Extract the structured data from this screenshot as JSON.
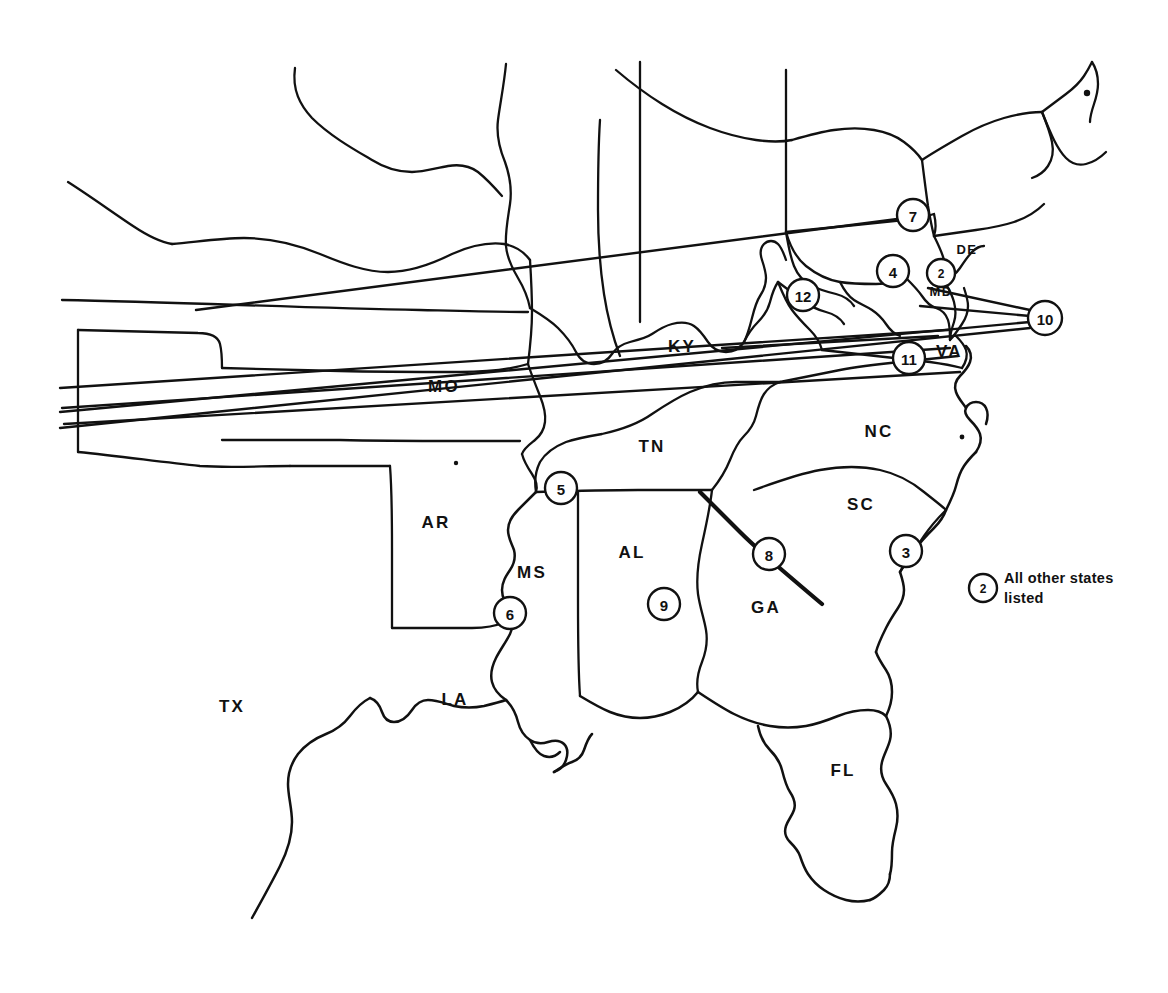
{
  "map": {
    "title": "Southeastern United States numbered reference map",
    "background_color": "#ffffff",
    "line_color": "#111111",
    "state_labels": [
      {
        "id": "tx",
        "text": "TX",
        "x": 232,
        "y": 712
      },
      {
        "id": "ar",
        "text": "AR",
        "x": 436,
        "y": 528
      },
      {
        "id": "la",
        "text": "LA",
        "x": 455,
        "y": 705
      },
      {
        "id": "ms",
        "text": "MS",
        "x": 532,
        "y": 578
      },
      {
        "id": "mo",
        "text": "MO",
        "x": 444,
        "y": 392
      },
      {
        "id": "al",
        "text": "AL",
        "x": 632,
        "y": 558
      },
      {
        "id": "tn",
        "text": "TN",
        "x": 652,
        "y": 452
      },
      {
        "id": "ky",
        "text": "KY",
        "x": 682,
        "y": 352
      },
      {
        "id": "ga",
        "text": "GA",
        "x": 766,
        "y": 613
      },
      {
        "id": "fl",
        "text": "FL",
        "x": 843,
        "y": 776
      },
      {
        "id": "sc",
        "text": "SC",
        "x": 861,
        "y": 510
      },
      {
        "id": "nc",
        "text": "NC",
        "x": 879,
        "y": 437
      },
      {
        "id": "va",
        "text": "VA",
        "x": 936,
        "y": 357
      },
      {
        "id": "md",
        "text": "MD",
        "x": 941,
        "y": 296
      },
      {
        "id": "de",
        "text": "DE",
        "x": 967,
        "y": 254
      }
    ],
    "markers": [
      {
        "number": "12",
        "x": 803,
        "y": 295,
        "r": 16,
        "state": "WV"
      },
      {
        "number": "7",
        "x": 913,
        "y": 215,
        "r": 16,
        "state": "PA"
      },
      {
        "number": "4",
        "x": 893,
        "y": 271,
        "r": 16,
        "state": "MD"
      },
      {
        "number": "2",
        "x": 941,
        "y": 273,
        "r": 14,
        "state": "DC"
      },
      {
        "number": "10",
        "x": 1045,
        "y": 318,
        "r": 17,
        "state": "NJ-CT-RI-DE"
      },
      {
        "number": "11",
        "x": 909,
        "y": 358,
        "r": 16,
        "state": "VA"
      },
      {
        "number": "3",
        "x": 906,
        "y": 551,
        "r": 16,
        "state": "SC-coast"
      },
      {
        "number": "8",
        "x": 769,
        "y": 554,
        "r": 16,
        "state": "GA-SC-border"
      },
      {
        "number": "5",
        "x": 561,
        "y": 488,
        "r": 16,
        "state": "TN-MS-border"
      },
      {
        "number": "6",
        "x": 510,
        "y": 613,
        "r": 16,
        "state": "MS-west-border"
      },
      {
        "number": "9",
        "x": 664,
        "y": 604,
        "r": 16,
        "state": "AL"
      }
    ],
    "legend": {
      "marker_number": "2",
      "marker_x": 983,
      "marker_y": 588,
      "marker_r": 14,
      "line1": "All other states",
      "line2": "listed",
      "text_x": 1004,
      "text_y_line1": 583,
      "text_y_line2": 603
    }
  }
}
